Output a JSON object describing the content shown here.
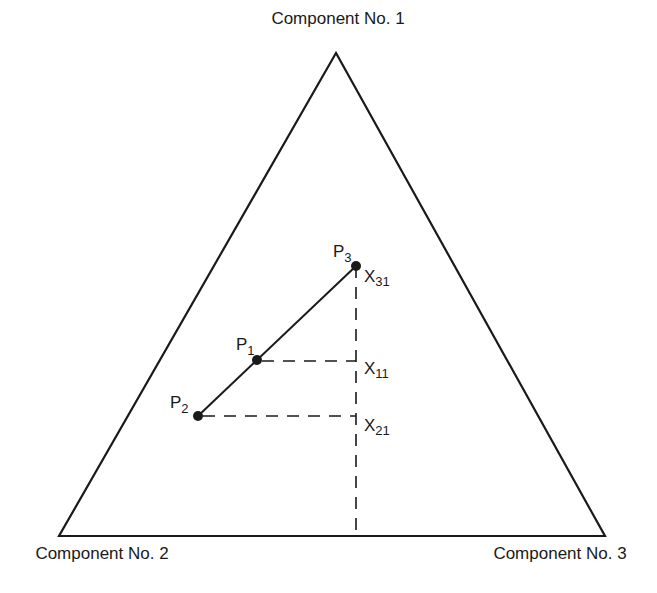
{
  "vertices": {
    "top": {
      "label": "Component No. 1",
      "x": 336,
      "y": 53
    },
    "bottom_left": {
      "label": "Component No. 2",
      "x": 59,
      "y": 536
    },
    "bottom_right": {
      "label": "Component No. 3",
      "x": 605,
      "y": 536
    }
  },
  "points": [
    {
      "id": "P1",
      "label": "P",
      "sub": "1",
      "x": 257,
      "y": 360
    },
    {
      "id": "P2",
      "label": "P",
      "sub": "2",
      "x": 198,
      "y": 416
    },
    {
      "id": "P3",
      "label": "P",
      "sub": "3",
      "x": 356,
      "y": 266
    }
  ],
  "projections": [
    {
      "label": "X",
      "sub": "31"
    },
    {
      "label": "X",
      "sub": "11"
    },
    {
      "label": "X",
      "sub": "21"
    }
  ],
  "colors": {
    "ink": "#1a1a1a",
    "background": "#ffffff"
  }
}
